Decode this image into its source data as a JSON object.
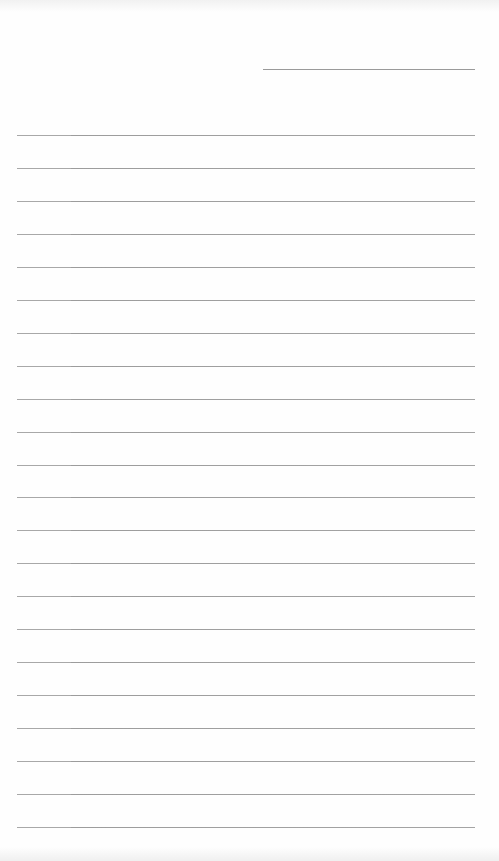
{
  "document": {
    "type": "lined-paper",
    "header_line": {
      "label": ""
    },
    "rules": [
      {
        "text": ""
      },
      {
        "text": ""
      },
      {
        "text": ""
      },
      {
        "text": ""
      },
      {
        "text": ""
      },
      {
        "text": ""
      },
      {
        "text": ""
      },
      {
        "text": ""
      },
      {
        "text": ""
      },
      {
        "text": ""
      },
      {
        "text": ""
      },
      {
        "text": ""
      },
      {
        "text": ""
      },
      {
        "text": ""
      },
      {
        "text": ""
      },
      {
        "text": ""
      },
      {
        "text": ""
      },
      {
        "text": ""
      },
      {
        "text": ""
      },
      {
        "text": ""
      },
      {
        "text": ""
      },
      {
        "text": ""
      }
    ],
    "colors": {
      "paper": "#fefefe",
      "rule": "#a4a4a4"
    }
  }
}
